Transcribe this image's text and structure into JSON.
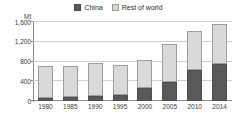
{
  "chart_data": {
    "type": "bar",
    "subtype": "stacked-bar",
    "title": "",
    "subtitle": "",
    "unit_label": "Mt",
    "xlabel": "",
    "ylabel": "",
    "categories": [
      "1980",
      "1985",
      "1990",
      "1995",
      "2000",
      "2005",
      "2010",
      "2014"
    ],
    "series": [
      {
        "name": "China",
        "color": "#595959",
        "values": [
          70,
          80,
          100,
          130,
          270,
          390,
          620,
          750
        ]
      },
      {
        "name": "Rest of world",
        "color": "#d9d9d9",
        "values": [
          630,
          620,
          660,
          600,
          570,
          760,
          800,
          800
        ]
      }
    ],
    "totals": [
      700,
      700,
      760,
      730,
      840,
      1150,
      1420,
      1550
    ],
    "ylim": [
      0,
      1600
    ],
    "yticks": [
      0,
      400,
      800,
      1200,
      1600
    ],
    "ytick_labels": [
      "0",
      "400",
      "800",
      "1,200",
      "1,600"
    ],
    "grid": true,
    "legend_position": "top-center"
  },
  "legend": {
    "items": [
      {
        "label": "China",
        "swatch": "china-swatch"
      },
      {
        "label": "Rest of world",
        "swatch": "rest-of-world-swatch"
      }
    ]
  },
  "axes": {
    "unit": "Mt"
  }
}
